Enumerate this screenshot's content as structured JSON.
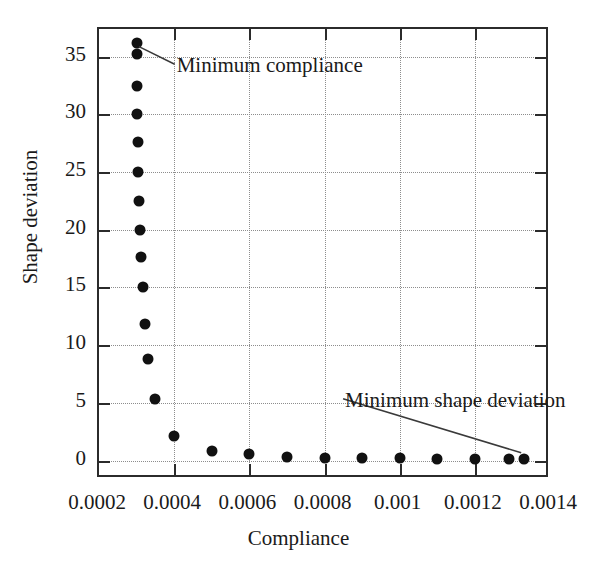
{
  "chart_data": {
    "type": "scatter",
    "title": "",
    "xlabel": "Compliance",
    "ylabel": "Shape deviation",
    "xlim": [
      0.0002,
      0.0014
    ],
    "ylim": [
      -1.6,
      37.4
    ],
    "grid": true,
    "legend": null,
    "x_ticks": [
      0.0002,
      0.0004,
      0.0006,
      0.0008,
      0.001,
      0.0012,
      0.0014
    ],
    "x_tick_labels": [
      "0.0002",
      "0.0004",
      "0.0006",
      "0.0008",
      "0.001",
      "0.0012",
      "0.0014"
    ],
    "y_ticks": [
      0,
      5,
      10,
      15,
      20,
      25,
      30,
      35
    ],
    "y_tick_labels": [
      "0",
      "5",
      "10",
      "15",
      "20",
      "25",
      "30",
      "35"
    ],
    "marker": "filled-circle",
    "marker_color": "#111111",
    "points": [
      {
        "x": 0.0003,
        "y": 36.2
      },
      {
        "x": 0.0003,
        "y": 35.2
      },
      {
        "x": 0.000301,
        "y": 32.5
      },
      {
        "x": 0.000302,
        "y": 30.0
      },
      {
        "x": 0.000303,
        "y": 27.6
      },
      {
        "x": 0.000305,
        "y": 25.0
      },
      {
        "x": 0.000307,
        "y": 22.5
      },
      {
        "x": 0.000309,
        "y": 20.0
      },
      {
        "x": 0.000312,
        "y": 17.6
      },
      {
        "x": 0.000316,
        "y": 15.0
      },
      {
        "x": 0.000322,
        "y": 11.8
      },
      {
        "x": 0.000331,
        "y": 8.8
      },
      {
        "x": 0.00035,
        "y": 5.3
      },
      {
        "x": 0.0004,
        "y": 2.1
      },
      {
        "x": 0.0005,
        "y": 0.8
      },
      {
        "x": 0.0006,
        "y": 0.55
      },
      {
        "x": 0.0007,
        "y": 0.33
      },
      {
        "x": 0.0008,
        "y": 0.25
      },
      {
        "x": 0.0009,
        "y": 0.2
      },
      {
        "x": 0.001,
        "y": 0.18
      },
      {
        "x": 0.0011,
        "y": 0.16
      },
      {
        "x": 0.0012,
        "y": 0.14
      },
      {
        "x": 0.00129,
        "y": 0.13
      },
      {
        "x": 0.00133,
        "y": 0.12
      }
    ],
    "annotations": [
      {
        "id": "minimum-compliance",
        "text": "Minimum compliance",
        "text_x": 0.000412,
        "text_y": 34.0,
        "target_x": 0.000301,
        "target_y": 35.7
      },
      {
        "id": "minimum-shape-deviation",
        "text": "Minimum shape deviation",
        "text_x": 0.00086,
        "text_y": 5.0,
        "target_x": 0.001318,
        "target_y": 0.5
      }
    ]
  }
}
